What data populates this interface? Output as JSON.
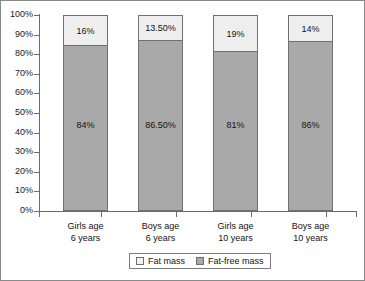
{
  "chart_data": {
    "type": "bar",
    "title": "",
    "xlabel": "",
    "ylabel": "",
    "stacked": true,
    "ylim": [
      0,
      100
    ],
    "grid": false,
    "legend_position": "bottom",
    "categories": [
      "Girls age\n6 years",
      "Boys age\n6 years",
      "Girls age\n10 years",
      "Boys age\n10 years"
    ],
    "category_lines": [
      [
        "Girls age",
        "6 years"
      ],
      [
        "Boys age",
        "6 years"
      ],
      [
        "Girls age",
        "10 years"
      ],
      [
        "Boys age",
        "10 years"
      ]
    ],
    "series": [
      {
        "name": "Fat-free mass",
        "color": "#a9a9a9",
        "values": [
          84,
          86.5,
          81,
          86
        ],
        "labels": [
          "84%",
          "86.50%",
          "81%",
          "86%"
        ]
      },
      {
        "name": "Fat mass",
        "color": "#eeeeee",
        "values": [
          16,
          13.5,
          19,
          14
        ],
        "labels": [
          "16%",
          "13.50%",
          "19%",
          "14%"
        ]
      }
    ],
    "yticks": [
      0,
      10,
      20,
      30,
      40,
      50,
      60,
      70,
      80,
      90,
      100
    ],
    "ytick_labels": [
      "0%",
      "10%",
      "20%",
      "30%",
      "40%",
      "50%",
      "60%",
      "70%",
      "80%",
      "90%",
      "100%"
    ]
  },
  "legend": {
    "entries": [
      {
        "label": "Fat mass",
        "swatch": "fat-mass-swatch"
      },
      {
        "label": "Fat-free mass",
        "swatch": "fat-free-mass-swatch"
      }
    ]
  },
  "axis": {
    "y_labels": [
      "100%",
      "90%",
      "80%",
      "70%",
      "60%",
      "50%",
      "40%",
      "30%",
      "20%",
      "10%",
      "0%"
    ]
  }
}
